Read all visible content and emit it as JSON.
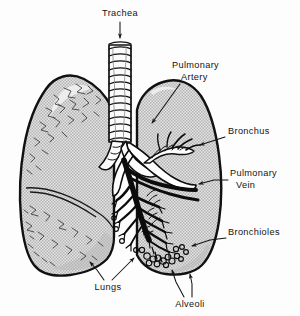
{
  "figure": {
    "background_color": "#fdfdfd",
    "ink_color": "#141414",
    "lung_fill_color": "#c8c8c8",
    "lung_outline_color": "#111111"
  },
  "labels": {
    "trachea": "Trachea",
    "pulmonary_artery_line1": "Pulmonary",
    "pulmonary_artery_line2": "Artery",
    "bronchus": "Bronchus",
    "pulmonary_vein_line1": "Pulmonary",
    "pulmonary_vein_line2": "Vein",
    "bronchioles": "Bronchioles",
    "lungs": "Lungs",
    "alveoli": "Alveoli"
  },
  "parts": [
    {
      "id": "trachea",
      "name": "Trachea",
      "description": "ribbed cartilage tube descending from top center"
    },
    {
      "id": "pulmonary-artery",
      "name": "Pulmonary Artery",
      "description": "white vessel entering the right lung at the hilum"
    },
    {
      "id": "bronchus",
      "name": "Bronchus",
      "description": "ringed airway branching inside the right lung"
    },
    {
      "id": "pulmonary-vein",
      "name": "Pulmonary Vein",
      "description": "dark vessel running through the hilum"
    },
    {
      "id": "bronchioles",
      "name": "Bronchioles",
      "description": "fine dark branching airways in the lower right lung"
    },
    {
      "id": "lungs",
      "name": "Lungs",
      "description": "two gray shaded lobed organs"
    },
    {
      "id": "alveoli",
      "name": "Alveoli",
      "description": "small terminal sacs at the bronchiole tips"
    }
  ]
}
